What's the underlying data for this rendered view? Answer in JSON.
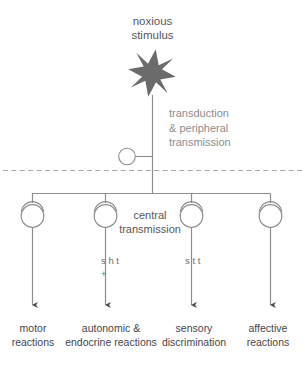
{
  "diagram": {
    "source_label": {
      "text": "noxious\nstimulus",
      "icon": "starburst-icon"
    },
    "stage_labels": {
      "peripheral": "transduction\n& peripheral\ntransmission",
      "central": "central\ntransmission"
    },
    "pathway_markers": [
      {
        "name": "left-marker",
        "text": "s\nh\nt\n+"
      },
      {
        "name": "right-marker",
        "text": "s\nt\nt"
      }
    ],
    "outcomes": [
      {
        "name": "motor",
        "label": "motor\nreactions"
      },
      {
        "name": "autonomic-endocrine",
        "label": "autonomic\n& endocrine\nreactions"
      },
      {
        "name": "sensory",
        "label": "sensory\ndiscrimination"
      },
      {
        "name": "affective",
        "label": "affective\nreactions"
      }
    ],
    "colors": {
      "star_fill": "#6b6b6b",
      "line": "#8e8e90",
      "dashed_line": "#a8a8aa",
      "arrow": "#4a4a4c",
      "text_dark": "#46464a",
      "text_gray": "#8d8d8f"
    }
  }
}
